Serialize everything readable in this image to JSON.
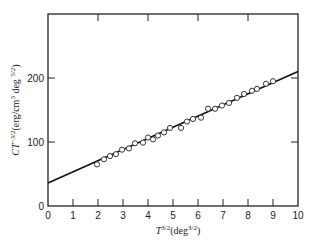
{
  "chart_data": {
    "type": "scatter",
    "title": "",
    "xlabel": "T^{3/2}(deg^{3/2})",
    "ylabel": "CT^{-3/2}(erg/cm^3 deg^{5/2})",
    "xlabel_parts": {
      "base": "T",
      "sup": "3/2",
      "unit_open": "(deg",
      "unit_sup": "3/2",
      "unit_close": ")"
    },
    "ylabel_parts": {
      "base": "CT",
      "sup": "−3/2",
      "unit_open": "(erg/cm",
      "unit_sup1": "3",
      "unit_mid": " deg ",
      "unit_sup2": "5/2",
      "unit_close": ")"
    },
    "xlim": [
      0,
      10
    ],
    "ylim": [
      0,
      300
    ],
    "xticks": [
      0,
      1,
      2,
      3,
      4,
      5,
      6,
      7,
      8,
      9,
      10
    ],
    "yticks": [
      0,
      100,
      200
    ],
    "grid": false,
    "legend": null,
    "series": [
      {
        "name": "measured",
        "marker": "open-circle",
        "x": [
          1.96,
          2.24,
          2.48,
          2.72,
          2.96,
          3.24,
          3.48,
          3.8,
          4.0,
          4.2,
          4.4,
          4.64,
          4.88,
          5.32,
          5.56,
          5.8,
          6.12,
          6.4,
          6.68,
          6.96,
          7.24,
          7.56,
          7.84,
          8.16,
          8.36,
          8.72,
          9.0
        ],
        "y": [
          65,
          73,
          78,
          81,
          88,
          90,
          98,
          99,
          107,
          104,
          110,
          115,
          122,
          122,
          132,
          136,
          138,
          152,
          152,
          157,
          161,
          169,
          175,
          180,
          183,
          191,
          195
        ]
      },
      {
        "name": "linear fit",
        "type": "line",
        "x": [
          0,
          10
        ],
        "y": [
          36,
          210
        ]
      }
    ]
  }
}
